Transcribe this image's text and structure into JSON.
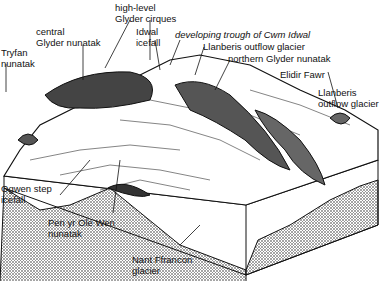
{
  "diagram": {
    "type": "block diagram of glaciated landscape",
    "colors": {
      "ink": "#111111",
      "stipple": "#9a9a9a",
      "paper": "#ffffff"
    }
  },
  "labels": {
    "high_level_cirques": {
      "line1": "high-level",
      "line2": "Glyder cirques"
    },
    "central_glyder": {
      "line1": "central",
      "line2": "Glyder nunatak"
    },
    "idwal_icefall": {
      "line1": "Idwal",
      "line2": "icefall"
    },
    "developing_trough": "developing trough of Cwm Idwal",
    "tryfan": {
      "line1": "Tryfan",
      "line2": "nunatak"
    },
    "llanberis_outflow_1": "Llanberis outflow glacier",
    "northern_glyder": "northern Glyder nunatak",
    "elidir_fawr": "Elidir Fawr",
    "llanberis_outflow_2": {
      "line1": "Llanberis",
      "line2": "outflow glacier"
    },
    "ogwen_step": {
      "line1": "Ogwen step",
      "line2": "icefall"
    },
    "pen_yr_ole_wen": {
      "line1": "Pen yr Ole Wen",
      "line2": "nunatak"
    },
    "nant_ffrancon": {
      "line1": "Nant Ffrancon",
      "line2": "glacier"
    }
  }
}
